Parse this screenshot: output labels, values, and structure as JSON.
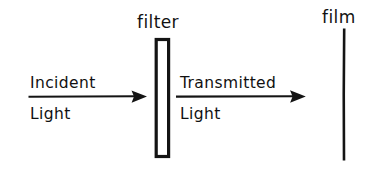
{
  "diagram": {
    "background_color": "#ffffff",
    "ink_color": "#141414",
    "style": "hand-drawn line diagram",
    "labels": {
      "filter": "filter",
      "film": "film",
      "incident_line1": "Incident",
      "incident_line2": "Light",
      "transmitted_line1": "Transmitted",
      "transmitted_line2": "Light"
    },
    "elements": {
      "filter_plate": {
        "name": "filter",
        "shape": "vertical rectangle",
        "fill": "#ffffff",
        "outline": "#141414"
      },
      "film_plane": {
        "name": "film",
        "shape": "vertical line",
        "color": "#141414"
      },
      "incident_arrow": {
        "name": "Incident Light",
        "direction": "left-to-right",
        "head": "solid triangle"
      },
      "transmitted_arrow": {
        "name": "Transmitted Light",
        "direction": "left-to-right",
        "head": "solid triangle"
      }
    }
  }
}
